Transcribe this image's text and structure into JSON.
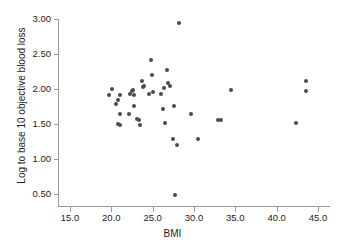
{
  "chart_data": {
    "type": "scatter",
    "title": "",
    "xlabel": "BMI",
    "ylabel": "Log to base 10 objective blood loss",
    "xlim": [
      13.5,
      46.5
    ],
    "ylim": [
      0.32,
      3.05
    ],
    "xticks": [
      "15.0",
      "20.0",
      "25.0",
      "30.0",
      "35.0",
      "40.0",
      "45.0"
    ],
    "xtick_values": [
      15.0,
      20.0,
      25.0,
      30.0,
      35.0,
      40.0,
      45.0
    ],
    "yticks": [
      "0.50",
      "1.00",
      "1.50",
      "2.00",
      "2.50",
      "3.00"
    ],
    "ytick_values": [
      0.5,
      1.0,
      1.5,
      2.0,
      2.5,
      3.0
    ],
    "grid": false,
    "legend": false,
    "marker_color": "#4a4a4a",
    "axis_color": "#9a9a9a",
    "points": [
      {
        "x": 19.7,
        "y": 1.92
      },
      {
        "x": 20.1,
        "y": 2.0
      },
      {
        "x": 20.6,
        "y": 1.78
      },
      {
        "x": 20.8,
        "y": 1.85
      },
      {
        "x": 20.8,
        "y": 1.5
      },
      {
        "x": 21.0,
        "y": 1.48
      },
      {
        "x": 21.1,
        "y": 1.91
      },
      {
        "x": 21.1,
        "y": 1.65
      },
      {
        "x": 22.1,
        "y": 1.64
      },
      {
        "x": 22.3,
        "y": 1.93
      },
      {
        "x": 22.5,
        "y": 1.97
      },
      {
        "x": 22.6,
        "y": 1.99
      },
      {
        "x": 22.7,
        "y": 1.76
      },
      {
        "x": 22.8,
        "y": 1.91
      },
      {
        "x": 23.1,
        "y": 1.57
      },
      {
        "x": 23.3,
        "y": 1.56
      },
      {
        "x": 23.5,
        "y": 1.49
      },
      {
        "x": 23.7,
        "y": 2.11
      },
      {
        "x": 23.8,
        "y": 2.03
      },
      {
        "x": 23.9,
        "y": 2.05
      },
      {
        "x": 24.6,
        "y": 1.93
      },
      {
        "x": 24.8,
        "y": 2.41
      },
      {
        "x": 24.9,
        "y": 2.2
      },
      {
        "x": 25.1,
        "y": 1.96
      },
      {
        "x": 26.0,
        "y": 1.93
      },
      {
        "x": 26.2,
        "y": 1.71
      },
      {
        "x": 26.4,
        "y": 2.02
      },
      {
        "x": 26.5,
        "y": 1.52
      },
      {
        "x": 26.7,
        "y": 2.27
      },
      {
        "x": 26.8,
        "y": 2.08
      },
      {
        "x": 27.1,
        "y": 2.04
      },
      {
        "x": 27.4,
        "y": 1.29
      },
      {
        "x": 27.6,
        "y": 1.76
      },
      {
        "x": 27.7,
        "y": 0.49
      },
      {
        "x": 28.0,
        "y": 1.2
      },
      {
        "x": 28.2,
        "y": 2.95
      },
      {
        "x": 29.6,
        "y": 1.65
      },
      {
        "x": 30.5,
        "y": 1.28
      },
      {
        "x": 32.9,
        "y": 1.56
      },
      {
        "x": 33.3,
        "y": 1.56
      },
      {
        "x": 34.5,
        "y": 1.98
      },
      {
        "x": 42.3,
        "y": 1.51
      },
      {
        "x": 43.6,
        "y": 1.97
      },
      {
        "x": 43.6,
        "y": 2.12
      }
    ]
  }
}
